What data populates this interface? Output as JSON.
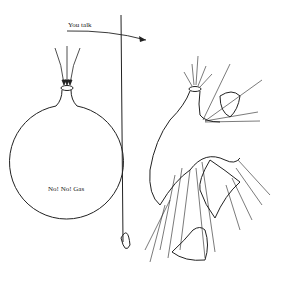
{
  "diagram": {
    "arrow_label": "You talk",
    "left_balloon_label": "No! No! Gas",
    "colors": {
      "ink": "#222222",
      "background": "#ffffff"
    },
    "panels": [
      {
        "name": "intact-balloon",
        "description": "Round flask/balloon with three arrows entering its neck"
      },
      {
        "name": "exploding-balloon",
        "description": "Balloon bursting with fragments and radiating lines"
      }
    ]
  }
}
